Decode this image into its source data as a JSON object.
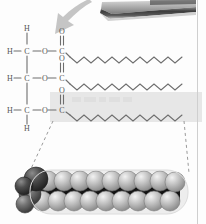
{
  "figure": {
    "background_color": "#fdfdfd",
    "page_rule_color": "#cfcfcf"
  },
  "top_object": {
    "name": "specimen-slab",
    "description": "dark angular object at top right",
    "color": "#4a4a4a"
  },
  "arrow": {
    "name": "pointer-arrow",
    "direction": "down-left",
    "color": "#a8a8a8"
  },
  "highlight_band": {
    "label": "",
    "color": "#e6e6e6",
    "x": 50,
    "y": 92,
    "width": 152,
    "height": 30
  },
  "structure": {
    "backbone_name": "glycerol-backbone",
    "bond_color": "#6e6e6e",
    "rows": [
      {
        "id": "row-1",
        "top_hydrogen": "H",
        "left_hydrogen": "H",
        "carbon": "C",
        "ester_oxygen": "O",
        "carbonyl_carbon": "C",
        "carbonyl_oxygen": "O",
        "bottom_hydrogen": ""
      },
      {
        "id": "row-2",
        "top_hydrogen": "",
        "left_hydrogen": "H",
        "carbon": "C",
        "ester_oxygen": "O",
        "carbonyl_carbon": "C",
        "carbonyl_oxygen": "O",
        "bottom_hydrogen": ""
      },
      {
        "id": "row-3",
        "top_hydrogen": "",
        "left_hydrogen": "H",
        "carbon": "C",
        "ester_oxygen": "O",
        "carbonyl_carbon": "C",
        "carbonyl_oxygen": "O",
        "bottom_hydrogen": "H"
      }
    ],
    "chains": [
      {
        "id": "fatty-acid-chain-1",
        "segments": 16,
        "y": 57,
        "x_start": 68,
        "x_end": 184,
        "amplitude": 5
      },
      {
        "id": "fatty-acid-chain-2",
        "segments": 16,
        "y": 84,
        "x_start": 68,
        "x_end": 184,
        "amplitude": 5
      },
      {
        "id": "fatty-acid-chain-3",
        "segments": 16,
        "y": 115,
        "x_start": 68,
        "x_end": 184,
        "amplitude": 5
      }
    ]
  },
  "callout": {
    "name": "magnification-callout",
    "line_style": "dashed",
    "color": "#9a9a9a",
    "left_line": {
      "x1": 52,
      "y1": 122,
      "x2": 30,
      "y2": 172
    },
    "right_line": {
      "x1": 185,
      "y1": 122,
      "x2": 188,
      "y2": 172
    }
  },
  "space_filling_model": {
    "name": "space-filling-model",
    "capsule_color": "#efefef",
    "carbon_color": "#b9b9b9",
    "dark_atom_color": "#4d4d4d",
    "mid_atom_color": "#7a7a7a",
    "bond_color": "#1c1c1c",
    "top_row_atoms": 9,
    "bottom_row_atoms": 9,
    "head_atoms": 3,
    "x": 18,
    "y": 168,
    "width": 170,
    "height": 50
  }
}
